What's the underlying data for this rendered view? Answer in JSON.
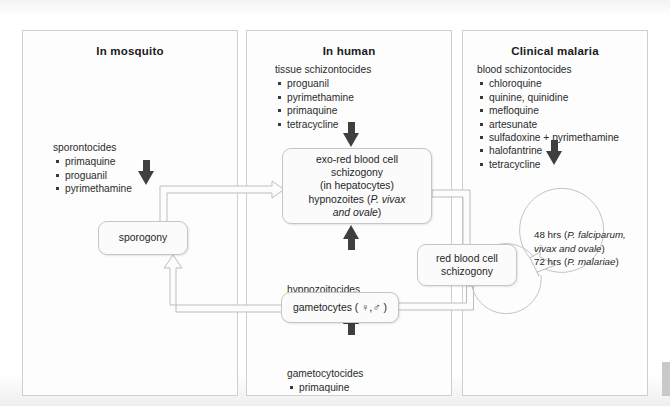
{
  "panels": [
    {
      "id": "mosquito",
      "title": "In mosquito",
      "drugs": {
        "head": "sporontocides",
        "items": [
          "primaquine",
          "proguanil",
          "pyrimethamine"
        ]
      }
    },
    {
      "id": "human",
      "title": "In human",
      "drugs": {
        "head": "tissue schizontocides",
        "items": [
          "proguanil",
          "pyrimethamine",
          "primaquine",
          "tetracycline"
        ]
      }
    },
    {
      "id": "clinical",
      "title": "Clinical malaria",
      "drugs": {
        "head": "blood schizontocides",
        "items": [
          "chloroquine",
          "quinine, quinidine",
          "mefloquine",
          "artesunate",
          "sulfadoxine + pyrimethamine",
          "halofantrine",
          "tetracycline"
        ]
      }
    }
  ],
  "nodes": {
    "sporogony": "sporogony",
    "exo_l1": "exo-red blood cell",
    "exo_l2": "schizogony",
    "exo_l3": "(in hepatocytes)",
    "exo_l4_a": "hypnozoites (",
    "exo_l4_b": "P. vivax",
    "exo_l5_a": "and ",
    "exo_l5_b": "ovale",
    "exo_l5_c": ")",
    "rbc_l1": "red blood cell",
    "rbc_l2": "schizogony",
    "gametocytes_a": "gametocytes ( ",
    "gametocytes_sym": "♀,♂",
    "gametocytes_b": " )"
  },
  "mid_drugs": {
    "head": "hypnozoitocides",
    "items": [
      "primaquine"
    ]
  },
  "bottom_drugs": {
    "head": "gametocytocides",
    "items": [
      "primaquine"
    ]
  },
  "cycle": {
    "line1_a": "48 hrs (",
    "line1_b": "P. falciparum,",
    "line2": "vivax and ovale",
    "line2_tail": ")",
    "line3_a": "72 hrs (",
    "line3_b": "P. malariae",
    "line3_c": ")"
  },
  "colors": {
    "panel_border": "#cfcfcf",
    "node_border": "#c6c6c6",
    "arrow_black": "#3f3f3f",
    "arrow_outline": "#bdbdbd"
  }
}
